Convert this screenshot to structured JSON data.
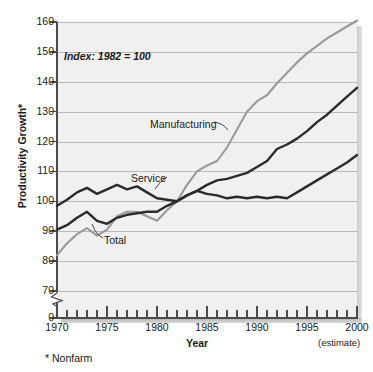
{
  "figure": {
    "index_note": "Index: 1982 = 100",
    "footnote": "* Nonfarm",
    "estimate_note": "(estimate)"
  },
  "chart_data": {
    "type": "line",
    "title": "",
    "xlabel": "Year",
    "ylabel": "Productivity Growth*",
    "xlim": [
      1970,
      2000
    ],
    "ylim": [
      70,
      160
    ],
    "y_axis_break_below": 70,
    "y_zero_shown": true,
    "grid": true,
    "legend": "inline-annotations",
    "yticks": [
      0,
      70,
      80,
      90,
      100,
      110,
      120,
      130,
      140,
      150,
      160
    ],
    "ytick_labels": [
      "0",
      "70",
      "80",
      "90",
      "100",
      "110",
      "120",
      "130",
      "140",
      "150",
      "160"
    ],
    "xticks": [
      1970,
      1975,
      1980,
      1985,
      1990,
      1995,
      2000
    ],
    "xtick_labels": [
      "1970",
      "1975",
      "1980",
      "1985",
      "1990",
      "1995",
      "2000"
    ],
    "x": [
      1970,
      1971,
      1972,
      1973,
      1974,
      1975,
      1976,
      1977,
      1978,
      1979,
      1980,
      1981,
      1982,
      1983,
      1984,
      1985,
      1986,
      1987,
      1988,
      1989,
      1990,
      1991,
      1992,
      1993,
      1994,
      1995,
      1996,
      1997,
      1998,
      1999,
      2000
    ],
    "series": [
      {
        "name": "Manufacturing",
        "color": "#9a9a9a",
        "values": [
          82,
          86,
          89,
          91,
          88.5,
          90.5,
          95,
          96.5,
          96.5,
          95,
          93.5,
          97,
          100,
          105.5,
          110,
          112,
          113.5,
          118,
          124,
          130,
          133.5,
          135.5,
          139.5,
          143,
          146.5,
          149.5,
          152,
          154.5,
          156.5,
          158.5,
          160.5
        ]
      },
      {
        "name": "Service",
        "color": "#2b2b2b",
        "values": [
          98.5,
          100.5,
          103,
          104.5,
          102.5,
          104,
          105.5,
          104,
          105,
          103,
          101,
          100.5,
          100,
          102,
          103.5,
          102.5,
          102,
          101,
          101.5,
          101,
          101.5,
          101,
          101.5,
          101,
          103,
          105,
          107,
          109,
          111,
          113,
          115.5
        ]
      },
      {
        "name": "Total",
        "color": "#2b2b2b",
        "values": [
          90.5,
          92,
          94.5,
          96.5,
          93.5,
          92.5,
          94.5,
          95.5,
          96,
          96.5,
          96.5,
          98.5,
          100,
          102,
          103.5,
          105.5,
          107,
          107.5,
          108.5,
          109.5,
          111.5,
          113.5,
          117.5,
          119,
          121,
          123.5,
          126.5,
          129,
          132,
          135,
          138
        ]
      }
    ],
    "annotations": [
      {
        "label": "Manufacturing",
        "series": "Manufacturing"
      },
      {
        "label": "Service",
        "series": "Service"
      },
      {
        "label": "Total",
        "series": "Total"
      }
    ]
  }
}
